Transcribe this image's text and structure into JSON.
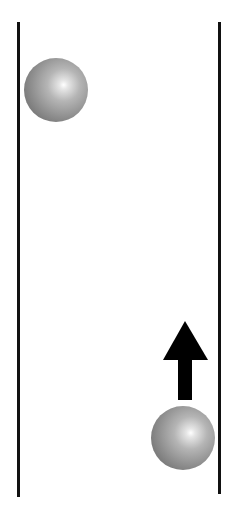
{
  "diagram": {
    "colors": {
      "wall": "#111111",
      "arrow": "#000000",
      "sphere_light": "#ffffff",
      "sphere_dark": "#5f5f5f",
      "background": "#ffffff"
    },
    "walls": [
      {
        "name": "left-wall",
        "x": 17,
        "y_top": 22,
        "y_bottom": 497
      },
      {
        "name": "right-wall",
        "x": 218,
        "y_top": 22,
        "y_bottom": 494
      }
    ],
    "spheres": [
      {
        "name": "upper-sphere",
        "cx": 56,
        "cy": 90,
        "r": 32
      },
      {
        "name": "lower-sphere",
        "cx": 183,
        "cy": 438,
        "r": 32
      }
    ],
    "arrow": {
      "direction": "up",
      "icon": "arrow-up-icon",
      "tip": [
        185,
        321
      ],
      "head_base_y": 360,
      "head_left_x": 163,
      "head_right_x": 208,
      "shaft_left_x": 178,
      "shaft_right_x": 192,
      "shaft_bottom_y": 400
    }
  }
}
